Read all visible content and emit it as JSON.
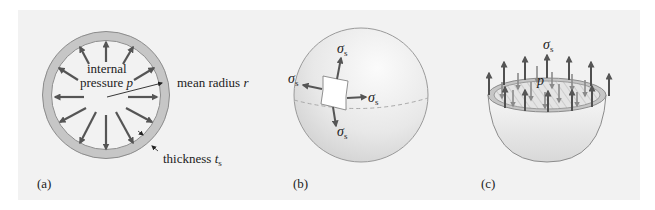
{
  "figure": {
    "background": "#f2f2f2",
    "panels": [
      {
        "id": "a",
        "caption": "(a)",
        "labels": {
          "internal_line1": "internal",
          "internal_line2": "pressure",
          "pressure_symbol": "p",
          "mean_radius": "mean radius",
          "radius_symbol": "r",
          "thickness": "thickness",
          "thickness_symbol": "t",
          "thickness_subscript": "s"
        }
      },
      {
        "id": "b",
        "caption": "(b)",
        "labels": {
          "stress_symbol": "σ",
          "stress_subscript": "s"
        }
      },
      {
        "id": "c",
        "caption": "(c)",
        "labels": {
          "stress_symbol": "σ",
          "stress_subscript": "s",
          "pressure_symbol": "p"
        }
      }
    ],
    "colors": {
      "arrow": "#555555",
      "ring_fill": "#c8c8c8",
      "ring_stroke": "#888888",
      "sphere_fill": "#e6e6e6",
      "sphere_stroke": "#999999",
      "element_fill": "#ffffff"
    }
  }
}
